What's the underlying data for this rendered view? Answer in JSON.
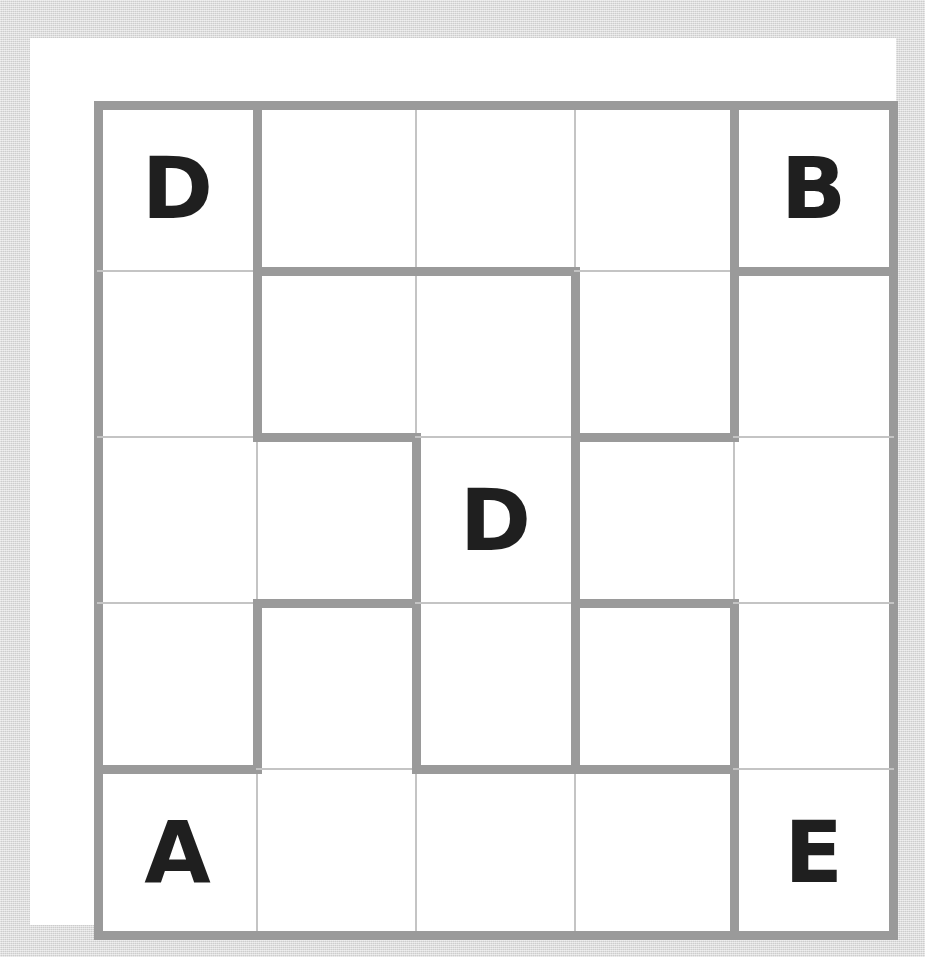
{
  "puzzle": {
    "title": "letter-region-grid",
    "rows": 5,
    "cols": 5,
    "colors": {
      "backdrop": "#d6d6d6",
      "paper": "#ffffff",
      "cell": "#ffffff",
      "thick_wall": "#9a9a9a",
      "thin_wall": "#c4c4c4",
      "letter": "#1f1f1f"
    },
    "geometry": {
      "origin_x": 68,
      "origin_y": 67,
      "cell_width": 159,
      "cell_height": 166,
      "thick_wall_px": 9,
      "thin_wall_px": 2
    },
    "cells": [
      [
        {
          "row": 0,
          "col": 0,
          "letter": "D"
        },
        {
          "row": 0,
          "col": 1,
          "letter": ""
        },
        {
          "row": 0,
          "col": 2,
          "letter": ""
        },
        {
          "row": 0,
          "col": 3,
          "letter": ""
        },
        {
          "row": 0,
          "col": 4,
          "letter": "B"
        }
      ],
      [
        {
          "row": 1,
          "col": 0,
          "letter": ""
        },
        {
          "row": 1,
          "col": 1,
          "letter": ""
        },
        {
          "row": 1,
          "col": 2,
          "letter": ""
        },
        {
          "row": 1,
          "col": 3,
          "letter": ""
        },
        {
          "row": 1,
          "col": 4,
          "letter": ""
        }
      ],
      [
        {
          "row": 2,
          "col": 0,
          "letter": ""
        },
        {
          "row": 2,
          "col": 1,
          "letter": ""
        },
        {
          "row": 2,
          "col": 2,
          "letter": "D"
        },
        {
          "row": 2,
          "col": 3,
          "letter": ""
        },
        {
          "row": 2,
          "col": 4,
          "letter": ""
        }
      ],
      [
        {
          "row": 3,
          "col": 0,
          "letter": ""
        },
        {
          "row": 3,
          "col": 1,
          "letter": ""
        },
        {
          "row": 3,
          "col": 2,
          "letter": ""
        },
        {
          "row": 3,
          "col": 3,
          "letter": ""
        },
        {
          "row": 3,
          "col": 4,
          "letter": ""
        }
      ],
      [
        {
          "row": 4,
          "col": 0,
          "letter": "A"
        },
        {
          "row": 4,
          "col": 1,
          "letter": ""
        },
        {
          "row": 4,
          "col": 2,
          "letter": ""
        },
        {
          "row": 4,
          "col": 3,
          "letter": ""
        },
        {
          "row": 4,
          "col": 4,
          "letter": "E"
        }
      ]
    ],
    "letters_placed": [
      {
        "letter": "D",
        "row": 0,
        "col": 0
      },
      {
        "letter": "B",
        "row": 0,
        "col": 4
      },
      {
        "letter": "D",
        "row": 2,
        "col": 2
      },
      {
        "letter": "A",
        "row": 4,
        "col": 0
      },
      {
        "letter": "E",
        "row": 4,
        "col": 4
      }
    ],
    "vertical_walls": [
      [
        2,
        2,
        2,
        2,
        2,
        2
      ],
      [
        2,
        2,
        2,
        2,
        2,
        2
      ],
      [
        2,
        2,
        2,
        2,
        2,
        2
      ],
      [
        2,
        2,
        2,
        2,
        2,
        2
      ],
      [
        2,
        2,
        2,
        2,
        2,
        2
      ]
    ],
    "vertical_wall_thickness": [
      [
        "thick",
        "thick",
        "thin",
        "thin",
        "thick",
        "thick"
      ],
      [
        "thick",
        "thick",
        "thin",
        "thick",
        "thick",
        "thick"
      ],
      [
        "thick",
        "thin",
        "thick",
        "thick",
        "thin",
        "thick"
      ],
      [
        "thick",
        "thick",
        "thick",
        "thick",
        "thick",
        "thick"
      ],
      [
        "thick",
        "thin",
        "thin",
        "thin",
        "thick",
        "thick"
      ]
    ],
    "horizontal_wall_thickness": [
      [
        "thick",
        "thick",
        "thick",
        "thick",
        "thick"
      ],
      [
        "thin",
        "thick",
        "thick",
        "thin",
        "thick"
      ],
      [
        "thin",
        "thick",
        "thin",
        "thick",
        "thin"
      ],
      [
        "thin",
        "thick",
        "thin",
        "thick",
        "thin"
      ],
      [
        "thick",
        "thin",
        "thick",
        "thick",
        "thin"
      ],
      [
        "thick",
        "thick",
        "thick",
        "thick",
        "thick"
      ]
    ]
  }
}
